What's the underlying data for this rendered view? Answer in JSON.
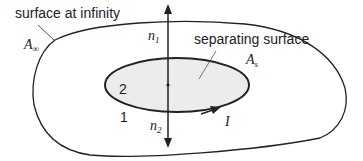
{
  "diagram": {
    "labels": {
      "outer_title": "surface at infinity",
      "inner_title": "separating surface",
      "region_inner": "2",
      "region_outer": "1",
      "normal_up": "n",
      "normal_up_sub": "1",
      "normal_down": "n",
      "normal_down_sub": "2",
      "area_infinity": "A",
      "area_infinity_sub": "∞",
      "area_separating": "A",
      "area_separating_sub": "s",
      "current": "I"
    },
    "colors": {
      "stroke": "#222222",
      "inner_fill": "#ececec",
      "background": "#ffffff"
    }
  }
}
